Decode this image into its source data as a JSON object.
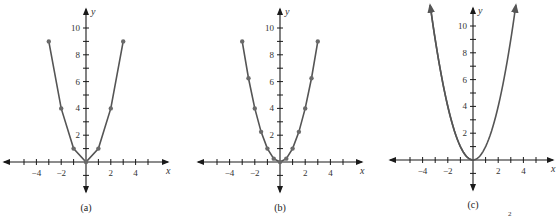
{
  "chart_data": [
    {
      "type": "line",
      "title": "",
      "caption": "(a)",
      "xlabel": "x",
      "ylabel": "y",
      "x_ticks": [
        -4,
        -2,
        2,
        4
      ],
      "y_ticks": [
        2,
        4,
        6,
        8,
        10
      ],
      "xlim": [
        -5.5,
        5.5
      ],
      "ylim": [
        -2,
        11
      ],
      "grid": false,
      "markers": true,
      "series": [
        {
          "name": "y = x^2 (integer points)",
          "x": [
            -3,
            -2,
            -1,
            0,
            1,
            2,
            3
          ],
          "y": [
            9,
            4,
            1,
            0,
            1,
            4,
            9
          ]
        }
      ]
    },
    {
      "type": "line",
      "title": "",
      "caption": "(b)",
      "xlabel": "x",
      "ylabel": "y",
      "x_ticks": [
        -4,
        -2,
        2,
        4
      ],
      "y_ticks": [
        2,
        4,
        6,
        8,
        10
      ],
      "xlim": [
        -5.5,
        5.5
      ],
      "ylim": [
        -2,
        11
      ],
      "grid": false,
      "markers": true,
      "series": [
        {
          "name": "y = x^2 (half-integer points)",
          "x": [
            -3,
            -2.5,
            -2,
            -1.5,
            -1,
            -0.5,
            0,
            0.5,
            1,
            1.5,
            2,
            2.5,
            3
          ],
          "y": [
            9,
            6.25,
            4,
            2.25,
            1,
            0.25,
            0,
            0.25,
            1,
            2.25,
            4,
            6.25,
            9
          ]
        }
      ]
    },
    {
      "type": "line",
      "title": "",
      "caption": "(c)",
      "xlabel": "x",
      "ylabel": "y",
      "x_ticks": [
        -4,
        -2,
        2,
        4
      ],
      "y_ticks": [
        2,
        4,
        6,
        8,
        10
      ],
      "xlim": [
        -5.5,
        5.5
      ],
      "ylim": [
        -2,
        11
      ],
      "grid": false,
      "markers": false,
      "curve_arrows": true,
      "series": [
        {
          "name": "y = x^2 (continuous)",
          "function": "x^2",
          "x_range": [
            -3.4,
            3.4
          ]
        }
      ]
    }
  ],
  "panels": [
    {
      "caption": "(a)",
      "x_label": "x",
      "y_label": "y",
      "x_tick_labels": [
        "−4",
        "−2",
        "2",
        "4"
      ],
      "y_tick_labels": [
        "2",
        "4",
        "6",
        "8",
        "10"
      ]
    },
    {
      "caption": "(b)",
      "x_label": "x",
      "y_label": "y",
      "x_tick_labels": [
        "−4",
        "−2",
        "2",
        "4"
      ],
      "y_tick_labels": [
        "2",
        "4",
        "6",
        "8",
        "10"
      ]
    },
    {
      "caption": "(c)",
      "x_label": "x",
      "y_label": "y",
      "x_tick_labels": [
        "−4",
        "−2",
        "2",
        "4"
      ],
      "y_tick_labels": [
        "2",
        "4",
        "6",
        "8",
        "10"
      ]
    }
  ],
  "footer_fragment": "2",
  "colors": {
    "axis": "#1a1a1a",
    "curve": "#555555",
    "point": "#6a6a6a",
    "text": "#333333"
  }
}
